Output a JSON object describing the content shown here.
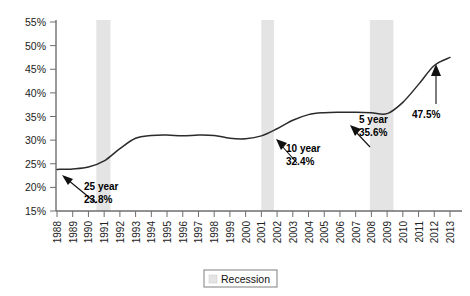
{
  "chart_data": {
    "type": "line",
    "title": "",
    "xlabel": "",
    "ylabel": "",
    "ylim": [
      15,
      55
    ],
    "ytick_values": [
      15,
      20,
      25,
      30,
      35,
      40,
      45,
      50,
      55
    ],
    "ytick_labels": [
      "15%",
      "20%",
      "25%",
      "30%",
      "35%",
      "40%",
      "45%",
      "50%",
      "55%"
    ],
    "grid": false,
    "legend_position": "bottom-center",
    "x": [
      1988,
      1989,
      1990,
      1991,
      1992,
      1993,
      1994,
      1995,
      1996,
      1997,
      1998,
      1999,
      2000,
      2001,
      2002,
      2003,
      2004,
      2005,
      2006,
      2007,
      2008,
      2009,
      2010,
      2011,
      2012,
      2013
    ],
    "xtick_labels": [
      "1988",
      "1989",
      "1990",
      "1991",
      "1992",
      "1993",
      "1994",
      "1995",
      "1996",
      "1997",
      "1998",
      "1999",
      "2000",
      "2001",
      "2002",
      "2003",
      "2004",
      "2005",
      "2006",
      "2007",
      "2008",
      "2009",
      "2010",
      "2011",
      "2012",
      "2013"
    ],
    "series": [
      {
        "name": "Share",
        "values": [
          23.8,
          23.9,
          24.3,
          25.6,
          28.2,
          30.4,
          31.0,
          31.1,
          30.9,
          31.1,
          31.0,
          30.4,
          30.3,
          30.9,
          32.4,
          34.2,
          35.4,
          35.8,
          35.9,
          35.9,
          35.8,
          35.6,
          38.0,
          41.8,
          45.8,
          47.5
        ]
      }
    ],
    "recession_bands": [
      {
        "start": 1990.5,
        "end": 1991.4
      },
      {
        "start": 2001.0,
        "end": 2001.8
      },
      {
        "start": 2007.9,
        "end": 2009.4
      }
    ],
    "annotations": [
      {
        "id": "annot-25-year",
        "title": "25 year",
        "value": "23.8%",
        "point_x": 1988,
        "point_y": 23.8
      },
      {
        "id": "annot-10-year",
        "title": "10 year",
        "value": "32.4%",
        "point_x": 2002,
        "point_y": 32.4
      },
      {
        "id": "annot-5-year",
        "title": "5 year",
        "value": "35.6%",
        "point_x": 2009,
        "point_y": 35.6
      },
      {
        "id": "annot-1-year",
        "title": "",
        "value": "47.5%",
        "point_x": 2013,
        "point_y": 47.5
      }
    ],
    "legend": [
      {
        "label": "Recession",
        "color": "#e4e4e4"
      }
    ]
  },
  "colors": {
    "line": "#2b2b2b",
    "recession": "#e4e4e4",
    "axis": "#6e6e6e",
    "background": "#ffffff"
  }
}
